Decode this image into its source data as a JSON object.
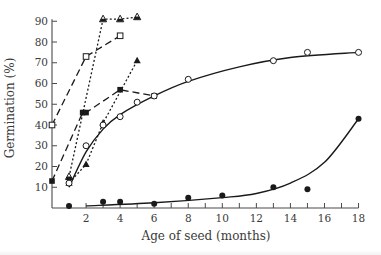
{
  "chart_data": {
    "type": "line",
    "title": "",
    "xlabel": "Age of seed (months)",
    "ylabel": "Germination (%)",
    "xlim": [
      0,
      18
    ],
    "ylim": [
      0,
      90
    ],
    "x_ticks": [
      2,
      4,
      6,
      8,
      10,
      12,
      14,
      16,
      18
    ],
    "x_minor_step": 1,
    "y_ticks": [
      10,
      20,
      30,
      40,
      50,
      60,
      70,
      80,
      90
    ],
    "grid": false,
    "legend": null,
    "series": [
      {
        "name": "open-squares-dashed",
        "marker": "open-square",
        "line": "long-dash",
        "points": [
          [
            0,
            40
          ],
          [
            2,
            73
          ],
          [
            4,
            83
          ]
        ]
      },
      {
        "name": "filled-squares-dashed",
        "marker": "filled-square",
        "line": "long-dash",
        "points": [
          [
            0,
            13
          ],
          [
            1.8,
            46
          ],
          [
            2,
            46
          ],
          [
            4,
            57
          ],
          [
            6,
            54
          ]
        ]
      },
      {
        "name": "half-filled-triangles-dotted",
        "marker": "half-triangle",
        "line": "dotted",
        "points": [
          [
            1,
            15
          ],
          [
            3,
            91
          ],
          [
            4,
            91
          ],
          [
            5,
            92
          ]
        ]
      },
      {
        "name": "filled-triangles-dotted",
        "marker": "filled-triangle",
        "line": "dotted",
        "points": [
          [
            1,
            12
          ],
          [
            2,
            21
          ],
          [
            3,
            41
          ],
          [
            5,
            71
          ]
        ]
      },
      {
        "name": "open-circles-solid",
        "marker": "open-circle",
        "line": "solid-curve",
        "points": [
          [
            1,
            12
          ],
          [
            2,
            30
          ],
          [
            3,
            40
          ],
          [
            4,
            44
          ],
          [
            5,
            51
          ],
          [
            6,
            54
          ],
          [
            8,
            62
          ],
          [
            13,
            71
          ],
          [
            15,
            75
          ],
          [
            18,
            75
          ]
        ]
      },
      {
        "name": "filled-circles-solid",
        "marker": "filled-circle",
        "line": "solid-curve",
        "points": [
          [
            1,
            1
          ],
          [
            3,
            3
          ],
          [
            4,
            3
          ],
          [
            6,
            2
          ],
          [
            8,
            5
          ],
          [
            10,
            6
          ],
          [
            13,
            10
          ],
          [
            15,
            9
          ],
          [
            18,
            43
          ]
        ]
      }
    ]
  },
  "plot": {
    "x0_px": 52,
    "x_px_per_unit": 17.03,
    "y0_px": 208,
    "y_px_per_unit": 2.075,
    "axis_color": "#4a4a4a",
    "ink_color": "#1a1a1a"
  }
}
